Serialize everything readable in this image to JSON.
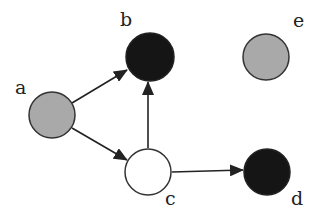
{
  "diagram": {
    "type": "directed-graph",
    "colors": {
      "gray": "#a9a9a9",
      "black": "#151515",
      "white": "#ffffff",
      "stroke": "#333333"
    },
    "nodes": [
      {
        "id": "a",
        "label": "a",
        "fill": "gray"
      },
      {
        "id": "b",
        "label": "b",
        "fill": "black"
      },
      {
        "id": "c",
        "label": "c",
        "fill": "white"
      },
      {
        "id": "d",
        "label": "d",
        "fill": "black"
      },
      {
        "id": "e",
        "label": "e",
        "fill": "gray"
      }
    ],
    "edges": [
      {
        "from": "a",
        "to": "b"
      },
      {
        "from": "a",
        "to": "c"
      },
      {
        "from": "c",
        "to": "b"
      },
      {
        "from": "c",
        "to": "d"
      }
    ]
  }
}
